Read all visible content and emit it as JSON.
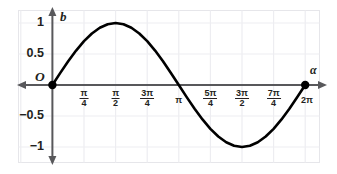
{
  "chart_data": {
    "type": "line",
    "title": "",
    "subtitle": "",
    "xlabel": "α",
    "ylabel": "b",
    "origin_label": "O",
    "grid": true,
    "legend": "none",
    "xlim": [
      -0.3926990817,
      7.0685834706
    ],
    "ylim": [
      -1.35,
      1.35
    ],
    "x_tick_values": [
      0.7853981634,
      1.5707963268,
      2.3561944902,
      3.1415926536,
      3.926990817,
      4.7123889804,
      5.4977871438,
      6.2831853072
    ],
    "x_tick_labels": [
      {
        "kind": "fraction",
        "num": "π",
        "den": "4",
        "text": "π/4"
      },
      {
        "kind": "fraction",
        "num": "π",
        "den": "2",
        "text": "π/2"
      },
      {
        "kind": "fraction",
        "num": "3π",
        "den": "4",
        "text": "3π/4"
      },
      {
        "kind": "plain",
        "num": "",
        "den": "",
        "text": "π"
      },
      {
        "kind": "fraction",
        "num": "5π",
        "den": "4",
        "text": "5π/4"
      },
      {
        "kind": "fraction",
        "num": "3π",
        "den": "2",
        "text": "3π/2"
      },
      {
        "kind": "fraction",
        "num": "7π",
        "den": "4",
        "text": "7π/4"
      },
      {
        "kind": "plain",
        "num": "",
        "den": "",
        "text": "2π"
      }
    ],
    "y_tick_values": [
      1,
      0.5,
      -0.5,
      -1
    ],
    "y_tick_labels": [
      "1",
      "0.5",
      "−0.5",
      "−1"
    ],
    "series": [
      {
        "name": "b = sin α",
        "color": "#000000",
        "x": [
          0,
          0.1963495408,
          0.3926990817,
          0.5890486225,
          0.7853981634,
          0.9817477042,
          1.1780972451,
          1.3744467859,
          1.5707963268,
          1.7671458676,
          1.9634954085,
          2.1598449493,
          2.3561944902,
          2.552544031,
          2.7488935719,
          2.9452431127,
          3.1415926536,
          3.3379421944,
          3.5342917352,
          3.7306412761,
          3.926990817,
          4.1233403578,
          4.3196898986,
          4.5160394395,
          4.7123889804,
          4.9087385212,
          5.105088062,
          5.3014376029,
          5.4977871438,
          5.6941366846,
          5.8904862254,
          6.0868357663,
          6.2831853072
        ],
        "y": [
          0,
          0.195090322,
          0.3826834324,
          0.555570233,
          0.7071067812,
          0.8314696123,
          0.9238795325,
          0.9807852804,
          1,
          0.9807852804,
          0.9238795325,
          0.8314696123,
          0.7071067812,
          0.555570233,
          0.3826834324,
          0.195090322,
          0,
          -0.195090322,
          -0.3826834324,
          -0.555570233,
          -0.7071067812,
          -0.8314696123,
          -0.9238795325,
          -0.9807852804,
          -1,
          -0.9807852804,
          -0.9238795325,
          -0.8314696123,
          -0.7071067812,
          -0.555570233,
          -0.3826834324,
          -0.195090322,
          0
        ]
      }
    ],
    "markers": [
      {
        "name": "origin-point",
        "x": 0,
        "y": 0
      },
      {
        "name": "endpoint-2pi",
        "x": 6.2831853072,
        "y": 0
      }
    ],
    "colors": {
      "curve": "#000000",
      "axis": "#4d4d4d",
      "grid": "#ececf0",
      "frame": "#e4e4e8",
      "text": "#231f20"
    }
  }
}
